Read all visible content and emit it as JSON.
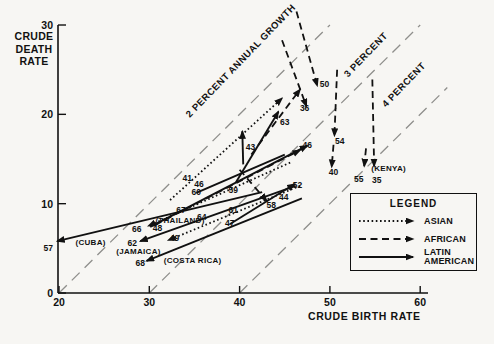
{
  "y_axis_title": "CRUDE DEATH RATE",
  "x_axis_title": "CRUDE BIRTH RATE",
  "legend": {
    "title": "LEGEND",
    "entries": [
      {
        "label": "ASIAN",
        "style": "dotted"
      },
      {
        "label": "AFRICAN",
        "style": "dashed"
      },
      {
        "label": "LATIN AMERICAN",
        "style": "solid"
      }
    ]
  },
  "chart_data": {
    "type": "line",
    "xlabel": "CRUDE BIRTH RATE",
    "ylabel": "CRUDE DEATH RATE",
    "xlim": [
      20,
      60
    ],
    "ylim": [
      0,
      30
    ],
    "x_ticks": [
      20,
      30,
      40,
      50,
      60
    ],
    "y_ticks": [
      0,
      10,
      20,
      30
    ],
    "grid": false,
    "legend_position": "lower-right",
    "growth_reference_lines": [
      {
        "label": "2 PERCENT ANNUAL GROWTH",
        "birth_minus_death": 20,
        "from": [
          20,
          0
        ],
        "to": [
          50,
          30
        ],
        "label_px": [
          243,
          63
        ],
        "rotation": -46
      },
      {
        "label": "3 PERCENT",
        "birth_minus_death": 30,
        "from": [
          30,
          0
        ],
        "to": [
          60,
          30
        ],
        "label_px": [
          368,
          57
        ],
        "rotation": -46
      },
      {
        "label": "4 PERCENT",
        "birth_minus_death": 40,
        "from": [
          40,
          0
        ],
        "to": [
          63,
          23
        ],
        "label_px": [
          406,
          87
        ],
        "rotation": -46
      }
    ],
    "series": [
      {
        "name": "cuba",
        "group": "latin-american",
        "style": "solid",
        "arrow": true,
        "points": [
          [
            42.5,
            11.3
          ],
          [
            19.8,
            5.8
          ]
        ]
      },
      {
        "name": "jamaica",
        "group": "latin-american",
        "style": "solid",
        "arrow": true,
        "points": [
          [
            46.2,
            12.0
          ],
          [
            29.0,
            5.8
          ]
        ]
      },
      {
        "name": "costa-rica",
        "group": "latin-american",
        "style": "solid",
        "arrow": true,
        "points": [
          [
            46.9,
            10.6
          ],
          [
            29.7,
            3.6
          ]
        ]
      },
      {
        "name": "latin-47-52",
        "group": "latin-american",
        "style": "solid",
        "arrow": true,
        "points": [
          [
            38.9,
            7.7
          ],
          [
            46.1,
            12.2
          ]
        ]
      },
      {
        "name": "latin-rising-long",
        "group": "latin-american",
        "style": "solid",
        "arrow": true,
        "points": [
          [
            30.1,
            7.4
          ],
          [
            47.5,
            16.5
          ]
        ]
      },
      {
        "name": "latin-steep",
        "group": "latin-american",
        "style": "solid",
        "arrow": true,
        "points": [
          [
            39.6,
            12.4
          ],
          [
            44.3,
            20.3
          ]
        ]
      },
      {
        "name": "spike-43",
        "group": "latin-american",
        "style": "solid",
        "arrow": true,
        "points": [
          [
            40.4,
            14.4
          ],
          [
            40.3,
            18.1
          ]
        ]
      },
      {
        "name": "latin-mid",
        "group": "latin-american",
        "style": "solid",
        "arrow": false,
        "points": [
          [
            35.2,
            11.2
          ],
          [
            45.0,
            15.5
          ]
        ]
      },
      {
        "name": "asian-ends-66",
        "group": "asian",
        "style": "dotted",
        "arrow": true,
        "points": [
          [
            45.6,
            14.6
          ],
          [
            29.9,
            7.5
          ]
        ]
      },
      {
        "name": "asian-ends-49",
        "group": "asian",
        "style": "dotted",
        "arrow": true,
        "points": [
          [
            46.7,
            12.0
          ],
          [
            32.1,
            5.9
          ]
        ]
      },
      {
        "name": "asian-steep",
        "group": "asian",
        "style": "dotted",
        "arrow": true,
        "points": [
          [
            32.3,
            10.4
          ],
          [
            44.7,
            21.8
          ]
        ]
      },
      {
        "name": "kenya-main",
        "group": "african",
        "style": "dashed",
        "arrow": true,
        "points": [
          [
            54.7,
            23.9
          ],
          [
            54.9,
            14.2
          ]
        ]
      },
      {
        "name": "kenya-short",
        "group": "african",
        "style": "dashed",
        "arrow": true,
        "points": [
          [
            54.0,
            16.2
          ],
          [
            53.8,
            14.2
          ]
        ]
      },
      {
        "name": "african-ends-50",
        "group": "african",
        "style": "dashed",
        "arrow": true,
        "points": [
          [
            46.3,
            31.5
          ],
          [
            48.6,
            23.2
          ]
        ]
      },
      {
        "name": "african-ends-36",
        "group": "african",
        "style": "dashed",
        "arrow": true,
        "points": [
          [
            44.7,
            28.3
          ],
          [
            47.4,
            20.9
          ]
        ]
      },
      {
        "name": "african-63",
        "group": "african",
        "style": "dashed",
        "arrow": true,
        "points": [
          [
            41.3,
            15.5
          ],
          [
            46.7,
            22.8
          ]
        ]
      },
      {
        "name": "african-54",
        "group": "african",
        "style": "dashed",
        "arrow": true,
        "points": [
          [
            50.8,
            25.0
          ],
          [
            50.5,
            17.6
          ]
        ]
      },
      {
        "name": "african-40",
        "group": "african",
        "style": "dashed",
        "arrow": true,
        "points": [
          [
            50.4,
            16.6
          ],
          [
            50.2,
            14.1
          ]
        ]
      },
      {
        "name": "african-mid",
        "group": "african",
        "style": "dashed",
        "arrow": true,
        "points": [
          [
            30.6,
            7.6
          ],
          [
            46.7,
            16.0
          ]
        ]
      },
      {
        "name": "african-58",
        "group": "african",
        "style": "dashed",
        "arrow": true,
        "points": [
          [
            40.0,
            13.8
          ],
          [
            43.0,
            10.3
          ]
        ]
      }
    ],
    "year_labels": [
      {
        "text": "57",
        "at": [
          18.8,
          5.0
        ]
      },
      {
        "text": "66",
        "at": [
          28.6,
          7.2
        ]
      },
      {
        "text": "48",
        "at": [
          30.9,
          7.3
        ]
      },
      {
        "text": "62",
        "at": [
          28.1,
          5.6
        ]
      },
      {
        "text": "68",
        "at": [
          29.0,
          3.4
        ]
      },
      {
        "text": "49",
        "at": [
          32.8,
          6.2
        ]
      },
      {
        "text": "67",
        "at": [
          33.5,
          9.3
        ]
      },
      {
        "text": "64",
        "at": [
          35.8,
          8.5
        ]
      },
      {
        "text": "41",
        "at": [
          34.2,
          12.9
        ]
      },
      {
        "text": "46",
        "at": [
          35.5,
          12.2
        ]
      },
      {
        "text": "60",
        "at": [
          35.2,
          11.3
        ]
      },
      {
        "text": "59",
        "at": [
          39.3,
          11.5
        ]
      },
      {
        "text": "61",
        "at": [
          39.3,
          9.3
        ]
      },
      {
        "text": "47",
        "at": [
          38.9,
          7.8
        ]
      },
      {
        "text": "43",
        "at": [
          41.2,
          16.3
        ]
      },
      {
        "text": "63",
        "at": [
          45.0,
          19.1
        ]
      },
      {
        "text": "36",
        "at": [
          47.2,
          20.7
        ]
      },
      {
        "text": "50",
        "at": [
          49.4,
          23.4
        ]
      },
      {
        "text": "46",
        "at": [
          47.5,
          16.6
        ]
      },
      {
        "text": "54",
        "at": [
          51.1,
          17.0
        ]
      },
      {
        "text": "40",
        "at": [
          50.4,
          13.6
        ]
      },
      {
        "text": "52",
        "at": [
          46.4,
          12.1
        ]
      },
      {
        "text": "44",
        "at": [
          44.9,
          10.8
        ]
      },
      {
        "text": "58",
        "at": [
          43.5,
          9.8
        ]
      },
      {
        "text": "55",
        "at": [
          53.2,
          12.8
        ]
      },
      {
        "text": "35",
        "at": [
          55.2,
          12.7
        ]
      }
    ],
    "country_labels": [
      {
        "text": "(CUBA)",
        "at": [
          23.5,
          5.7
        ]
      },
      {
        "text": "(JAMAICA)",
        "at": [
          28.8,
          4.7
        ]
      },
      {
        "text": "(COSTA RICA)",
        "at": [
          34.8,
          3.7
        ]
      },
      {
        "text": "(THAILAND)",
        "at": [
          33.4,
          8.2
        ]
      },
      {
        "text": "(KENYA)",
        "at": [
          56.5,
          14.0
        ]
      }
    ]
  }
}
